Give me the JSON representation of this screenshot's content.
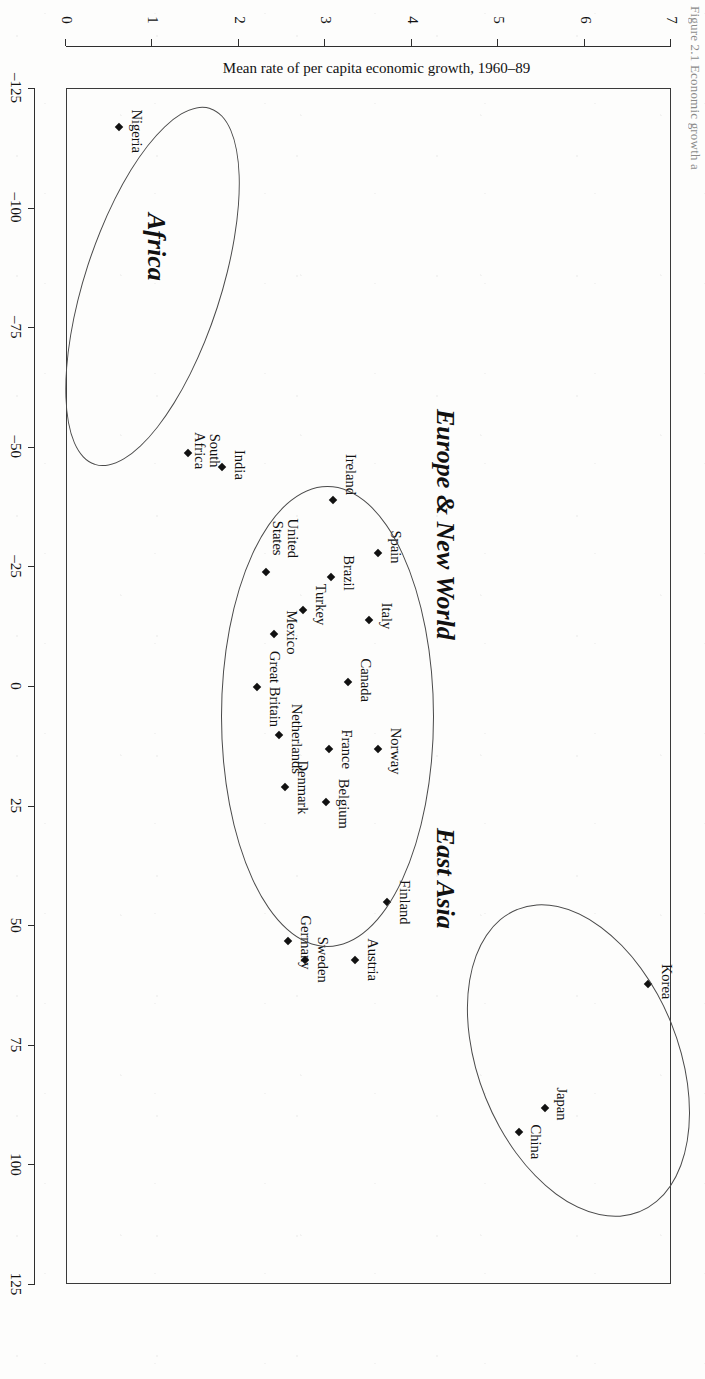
{
  "figure": {
    "caption_partial": "Figure 2.1  Economic growth a",
    "orientation_note_deg": 90
  },
  "chart_data": {
    "type": "scatter",
    "title": "",
    "xlabel": "Public's score on 4-item Achievement Motivation Index",
    "ylabel": "Mean rate of per capita economic growth, 1960–89",
    "xlim": [
      -125,
      125
    ],
    "ylim": [
      0,
      7
    ],
    "xticks": [
      -125,
      -100,
      -75,
      -50,
      -25,
      0,
      25,
      50,
      75,
      100,
      125
    ],
    "xticklabels": [
      "–125",
      "–100",
      "–75",
      "–50",
      "–25",
      "0",
      "25",
      "50",
      "75",
      "100",
      "125"
    ],
    "yticks": [
      0,
      1,
      2,
      3,
      4,
      5,
      6,
      7
    ],
    "yticklabels": [
      "0",
      "1",
      "2",
      "3",
      "4",
      "5",
      "6",
      "7"
    ],
    "grid": false,
    "legend": false,
    "marker": "filled-diamond",
    "points": [
      {
        "label": "Korea",
        "x": 62,
        "y": 6.75,
        "label_dx": -2,
        "label_dy": -26,
        "align": "center"
      },
      {
        "label": "Japan",
        "x": 88,
        "y": 5.55,
        "label_dx": -4,
        "label_dy": -24,
        "align": "center"
      },
      {
        "label": "China",
        "x": 93,
        "y": 5.25,
        "label_dx": 10,
        "label_dy": -24,
        "align": "center"
      },
      {
        "label": "Spain",
        "x": -28,
        "y": 3.62,
        "label_dx": -6,
        "label_dy": -25,
        "align": "center"
      },
      {
        "label": "Ireland",
        "x": -39,
        "y": 3.1,
        "label_dx": -26,
        "label_dy": -25,
        "align": "center"
      },
      {
        "label": "Italy",
        "x": -14,
        "y": 3.52,
        "label_dx": -4,
        "label_dy": -25,
        "align": "center"
      },
      {
        "label": "Brazil",
        "x": -23,
        "y": 3.08,
        "label_dx": -4,
        "label_dy": -25,
        "align": "center"
      },
      {
        "label": "Norway",
        "x": 13,
        "y": 3.62,
        "label_dx": 2,
        "label_dy": -25,
        "align": "center"
      },
      {
        "label": "Finland",
        "x": 45,
        "y": 3.72,
        "label_dx": 0,
        "label_dy": -25,
        "align": "center"
      },
      {
        "label": "Austria",
        "x": 57,
        "y": 3.35,
        "label_dx": 0,
        "label_dy": -25,
        "align": "center"
      },
      {
        "label": "Canada",
        "x": -1,
        "y": 3.28,
        "label_dx": -2,
        "label_dy": -25,
        "align": "center"
      },
      {
        "label": "France",
        "x": 13,
        "y": 3.05,
        "label_dx": 0,
        "label_dy": -25,
        "align": "center"
      },
      {
        "label": "Belgium",
        "x": 24,
        "y": 3.02,
        "label_dx": 2,
        "label_dy": -25,
        "align": "center"
      },
      {
        "label": "Sweden",
        "x": 57,
        "y": 2.78,
        "label_dx": 0,
        "label_dy": -25,
        "align": "center"
      },
      {
        "label": "Germany",
        "x": 53,
        "y": 2.58,
        "label_dx": 2,
        "label_dy": -25,
        "align": "center"
      },
      {
        "label": "Turkey",
        "x": -16,
        "y": 2.75,
        "label_dx": -6,
        "label_dy": -25,
        "align": "center"
      },
      {
        "label": "Denmark",
        "x": 21,
        "y": 2.55,
        "label_dx": 0,
        "label_dy": -25,
        "align": "center"
      },
      {
        "label": "Netherlands",
        "x": 10,
        "y": 2.48,
        "label_dx": 4,
        "label_dy": -25,
        "align": "center"
      },
      {
        "label": "Mexico",
        "x": -11,
        "y": 2.42,
        "label_dx": -2,
        "label_dy": -25,
        "align": "center"
      },
      {
        "label": "United\nStates",
        "x": -24,
        "y": 2.32,
        "label_dx": -34,
        "label_dy": -34,
        "align": "center"
      },
      {
        "label": "Great Britain",
        "x": 0,
        "y": 2.22,
        "label_dx": 2,
        "label_dy": -25,
        "align": "center"
      },
      {
        "label": "India",
        "x": -46,
        "y": 1.82,
        "label_dx": -2,
        "label_dy": -25,
        "align": "center"
      },
      {
        "label": "South\nAfrica",
        "x": -49,
        "y": 1.42,
        "label_dx": -2,
        "label_dy": -34,
        "align": "center"
      },
      {
        "label": "Nigeria",
        "x": -117,
        "y": 0.62,
        "label_dx": 4,
        "label_dy": -25,
        "align": "center"
      }
    ],
    "clusters": [
      {
        "name": "East Asia",
        "cx": 78,
        "cy": 5.95,
        "rx": 34,
        "ry": 1.15,
        "rot_deg": -22,
        "label_x": 40,
        "label_y": 4.4
      },
      {
        "name": "Europe & New World",
        "cx": 6,
        "cy": 3.05,
        "rx": 48,
        "ry": 1.22,
        "rot_deg": 0,
        "label_x": -34,
        "label_y": 4.4
      },
      {
        "name": "Africa",
        "cx": -84,
        "cy": 1.02,
        "rx": 39,
        "ry": 0.78,
        "rot_deg": 18,
        "label_x": -92,
        "label_y": 1.05
      }
    ]
  }
}
